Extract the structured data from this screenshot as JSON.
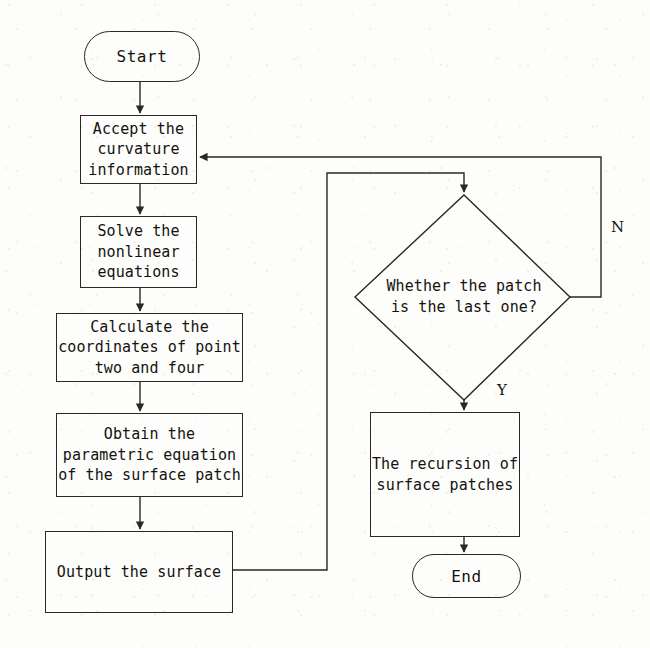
{
  "diagram": {
    "type": "flowchart",
    "orientation": "top-to-bottom, two columns",
    "nodes": [
      {
        "id": "start",
        "shape": "terminator",
        "label": "Start"
      },
      {
        "id": "accept",
        "shape": "process",
        "label": "Accept the\ncurvature\ninformation"
      },
      {
        "id": "solve",
        "shape": "process",
        "label": "Solve the\nnonlinear\nequations"
      },
      {
        "id": "calculate",
        "shape": "process",
        "label": "Calculate the\ncoordinates of point\ntwo and four"
      },
      {
        "id": "obtain",
        "shape": "process",
        "label": "Obtain the\nparametric equation\nof the surface patch"
      },
      {
        "id": "output",
        "shape": "process",
        "label": "Output the surface"
      },
      {
        "id": "decision",
        "shape": "diamond",
        "label": "Whether the patch\nis the last one?"
      },
      {
        "id": "recursion",
        "shape": "process",
        "label": "The recursion of\nsurface patches"
      },
      {
        "id": "end",
        "shape": "terminator",
        "label": "End"
      }
    ],
    "edges": [
      {
        "from": "start",
        "to": "accept",
        "label": ""
      },
      {
        "from": "accept",
        "to": "solve",
        "label": ""
      },
      {
        "from": "solve",
        "to": "calculate",
        "label": ""
      },
      {
        "from": "calculate",
        "to": "obtain",
        "label": ""
      },
      {
        "from": "obtain",
        "to": "output",
        "label": ""
      },
      {
        "from": "output",
        "to": "decision",
        "label": ""
      },
      {
        "from": "decision",
        "to": "accept",
        "label": "N"
      },
      {
        "from": "decision",
        "to": "recursion",
        "label": "Y"
      },
      {
        "from": "recursion",
        "to": "end",
        "label": ""
      }
    ],
    "edge_labels": {
      "no": "N",
      "yes": "Y"
    },
    "colors": {
      "stroke": "#2a2724",
      "text": "#14120f",
      "background": "#fdfdfb"
    }
  }
}
